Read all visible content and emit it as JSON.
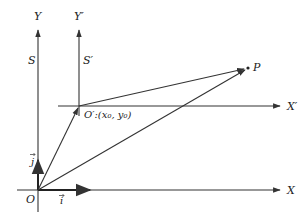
{
  "diagram": {
    "colors": {
      "line": "#333333",
      "background": "#ffffff"
    },
    "frames": [
      {
        "name": "S",
        "label": "S",
        "origin_label": "O",
        "x_axis_label": "X",
        "y_axis_label": "Y"
      },
      {
        "name": "S'",
        "label": "S′",
        "origin_label": "O′:(x₀, y₀)",
        "x_axis_label": "X′",
        "y_axis_label": "Y′"
      }
    ],
    "unit_vectors": {
      "i": "i⃗",
      "j": "j⃗"
    },
    "point": {
      "label": "P"
    },
    "labels": {
      "Y": "Y",
      "Yp": "Y′",
      "S": "S",
      "Sp": "S′",
      "X": "X",
      "Xp": "X′",
      "O": "O",
      "Op": "O′:(x₀, y₀)",
      "P": "P",
      "i": "i",
      "j": "j"
    },
    "vectors": [
      {
        "from": "O",
        "to": "O′",
        "description": "position of O′ in S"
      },
      {
        "from": "O",
        "to": "P",
        "description": "position of P in S"
      },
      {
        "from": "O′",
        "to": "P",
        "description": "position of P in S′"
      }
    ]
  }
}
